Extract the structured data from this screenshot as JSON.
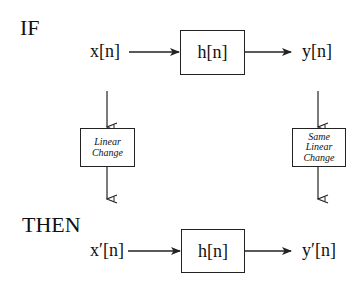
{
  "diagram": {
    "if_label": "IF",
    "then_label": "THEN",
    "top_row": {
      "input": "x[n]",
      "system": "h[n]",
      "output": "y[n]"
    },
    "left_change": {
      "line1": "Linear",
      "line2": "Change"
    },
    "right_change": {
      "line1": "Same",
      "line2": "Linear",
      "line3": "Change"
    },
    "bottom_row": {
      "input": "x′[n]",
      "system": "h[n]",
      "output": "y′[n]"
    },
    "colors": {
      "stroke": "#222222",
      "background": "#ffffff"
    }
  }
}
